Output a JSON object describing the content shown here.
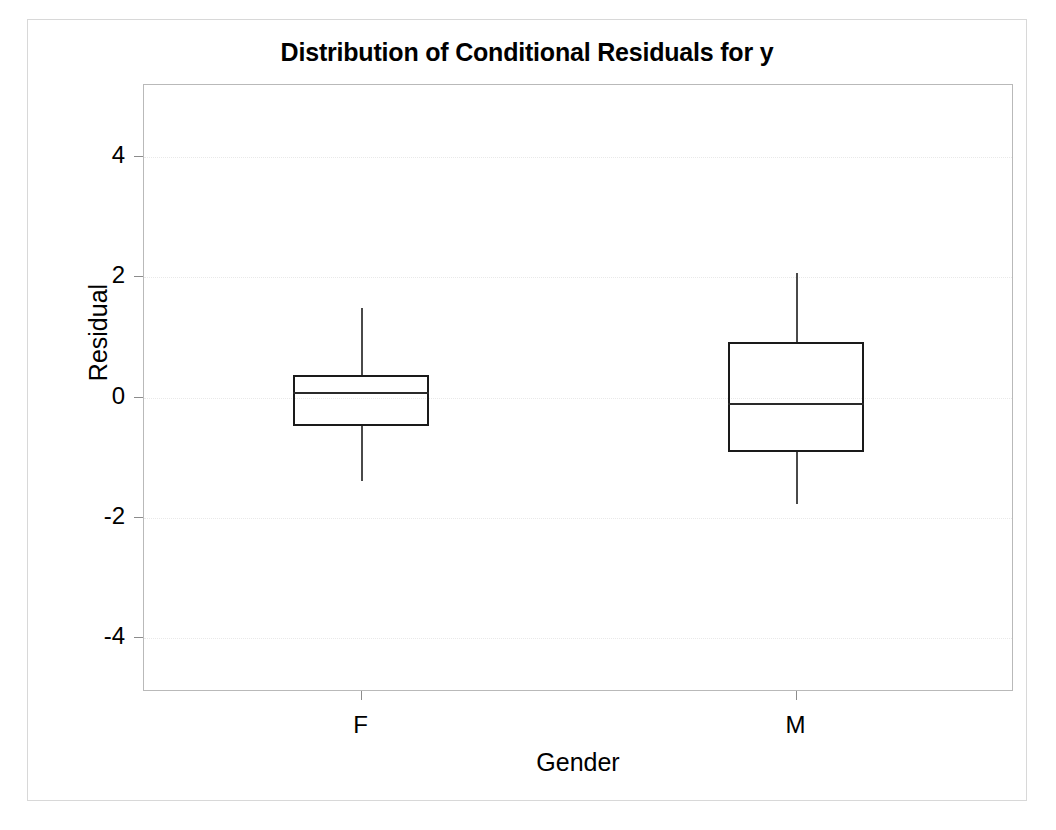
{
  "chart_data": {
    "type": "box",
    "title": "Distribution of Conditional Residuals for y",
    "xlabel": "Gender",
    "ylabel": "Residual",
    "categories": [
      "F",
      "M"
    ],
    "ytick_labels": [
      "4",
      "2",
      "0",
      "-2",
      "-4"
    ],
    "ytick_values": [
      4,
      2,
      0,
      -2,
      -4
    ],
    "ylim": [
      -4.9,
      5.2
    ],
    "grid": true,
    "legend": "none",
    "boxes": [
      {
        "category": "F",
        "whisker_low": -1.4,
        "q1": -0.49,
        "median": 0.08,
        "q3": 0.36,
        "whisker_high": 1.48
      },
      {
        "category": "M",
        "whisker_low": -1.79,
        "q1": -0.92,
        "median": -0.1,
        "q3": 0.9,
        "whisker_high": 2.06
      }
    ]
  },
  "figure": {
    "background_color": "#ffffff",
    "axis_color": "#b9b9b9",
    "grid_color": "#e9e9e9",
    "box_color": "#1a1a1a",
    "outer_border_color": "#d8d8d8"
  }
}
